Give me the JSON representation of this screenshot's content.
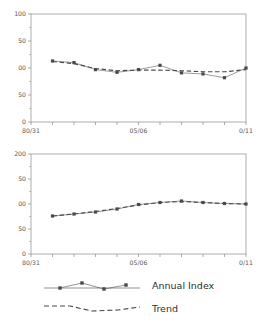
{
  "figure": {
    "background": "#ffffff",
    "series_color": "#4a4a4a",
    "axis_color": "#8a8a8a"
  },
  "legend": {
    "entries": [
      {
        "label": "Annual Index",
        "style": "solid-with-markers",
        "color": "#4a4a4a"
      },
      {
        "label": "Trend",
        "style": "dashed",
        "color": "#4a4a4a"
      }
    ]
  },
  "chart_data": [
    {
      "type": "line",
      "title": "",
      "xlabel": "",
      "ylabel": "",
      "panel": "top",
      "grid": false,
      "ylim": [
        0,
        200
      ],
      "yticks": [
        0,
        50,
        100,
        150,
        200
      ],
      "ytick_labels": [
        "0",
        "50",
        "00",
        "50",
        "100"
      ],
      "xlim": [
        0,
        10
      ],
      "xticks": [
        0,
        1,
        2,
        3,
        4,
        5,
        6,
        7,
        8,
        9,
        10
      ],
      "xtick_labels": [
        "80/31",
        "",
        "",
        "",
        "",
        "05/06",
        "",
        "",
        "",
        "",
        "0/11"
      ],
      "x": [
        1,
        2,
        3,
        4,
        5,
        6,
        7,
        8,
        9,
        10
      ],
      "series": [
        {
          "name": "Annual Index",
          "values": [
            113,
            110,
            97,
            92,
            97,
            105,
            91,
            89,
            82,
            100
          ]
        },
        {
          "name": "Trend",
          "values": [
            112,
            108,
            99,
            95,
            96,
            96,
            95,
            93,
            93,
            97
          ]
        }
      ]
    },
    {
      "type": "line",
      "title": "",
      "xlabel": "",
      "ylabel": "",
      "panel": "bottom",
      "grid": false,
      "ylim": [
        0,
        200
      ],
      "yticks": [
        0,
        50,
        100,
        150,
        200
      ],
      "ytick_labels": [
        "0",
        "50",
        "00",
        "50",
        "200"
      ],
      "xlim": [
        0,
        10
      ],
      "xticks": [
        0,
        1,
        2,
        3,
        4,
        5,
        6,
        7,
        8,
        9,
        10
      ],
      "xtick_labels": [
        "80/31",
        "",
        "",
        "",
        "",
        "05/06",
        "",
        "",
        "",
        "",
        "0/11"
      ],
      "x": [
        1,
        2,
        3,
        4,
        5,
        6,
        7,
        8,
        9,
        10
      ],
      "series": [
        {
          "name": "Annual Index",
          "values": [
            76,
            80,
            84,
            90,
            99,
            103,
            106,
            103,
            101,
            100
          ]
        },
        {
          "name": "Trend",
          "values": [
            76,
            80,
            85,
            91,
            98,
            103,
            105,
            103,
            101,
            100
          ]
        }
      ]
    }
  ]
}
